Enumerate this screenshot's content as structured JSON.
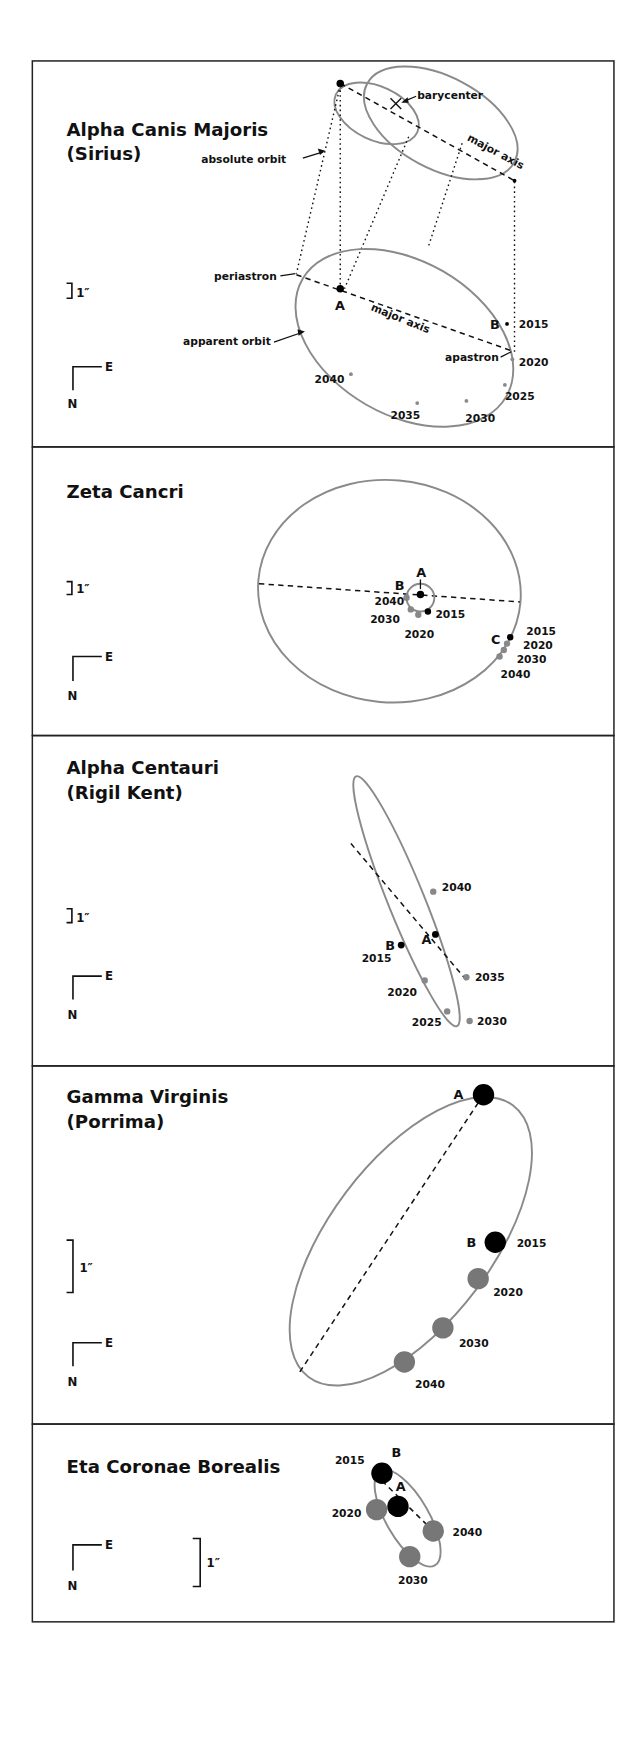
{
  "colors": {
    "orbit": "#8a8a8a",
    "primary_star": "#000000",
    "future_position": "#777777",
    "frame": "#222222"
  },
  "compass": {
    "east": "E",
    "north": "N"
  },
  "scale_label": "1″",
  "panels": [
    {
      "id": "sirius",
      "title_line1": "Alpha Canis Majoris",
      "title_line2": "(Sirius)",
      "labels": {
        "absolute_orbit": "absolute orbit",
        "barycenter": "barycenter",
        "major_axis_top": "major axis",
        "periastron": "periastron",
        "major_axis_bottom": "major axis",
        "apparent_orbit": "apparent orbit",
        "apastron": "apastron",
        "star_a": "A",
        "star_b": "B"
      },
      "years": [
        "2015",
        "2020",
        "2025",
        "2030",
        "2035",
        "2040"
      ]
    },
    {
      "id": "zeta-cancri",
      "title_line1": "Zeta Cancri",
      "labels": {
        "star_a": "A",
        "star_b": "B",
        "star_c": "C"
      },
      "years_b": [
        "2040",
        "2030",
        "2020",
        "2015"
      ],
      "years_c": [
        "2015",
        "2020",
        "2030",
        "2040"
      ]
    },
    {
      "id": "alpha-centauri",
      "title_line1": "Alpha Centauri",
      "title_line2": "(Rigil Kent)",
      "labels": {
        "star_a": "A",
        "star_b": "B"
      },
      "years": [
        "2040",
        "2015",
        "2035",
        "2020",
        "2025",
        "2030"
      ]
    },
    {
      "id": "porrima",
      "title_line1": "Gamma Virginis",
      "title_line2": "(Porrima)",
      "labels": {
        "star_a": "A",
        "star_b": "B"
      },
      "years": [
        "2015",
        "2020",
        "2030",
        "2040"
      ]
    },
    {
      "id": "eta-crb",
      "title_line1": "Eta Coronae Borealis",
      "labels": {
        "star_a": "A",
        "star_b": "B"
      },
      "years": [
        "2015",
        "2020",
        "2040",
        "2030"
      ]
    }
  ]
}
